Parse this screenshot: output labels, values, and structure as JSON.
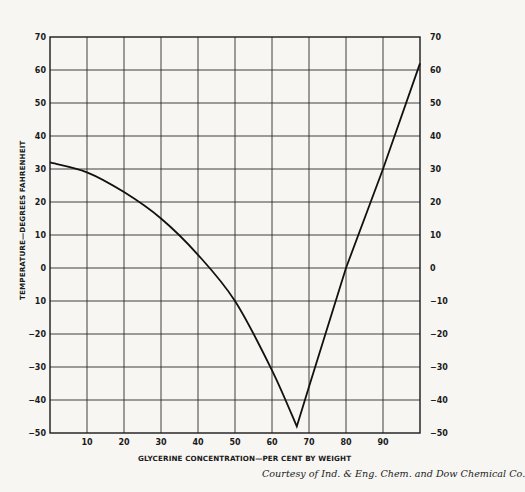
{
  "chart_data": {
    "type": "line",
    "title": "",
    "xlabel": "GLYCERINE CONCENTRATION—PER CENT BY WEIGHT",
    "ylabel": "TEMPERATURE—DEGREES FAHRENHEIT",
    "xlim": [
      0,
      100
    ],
    "ylim": [
      -50,
      70
    ],
    "grid": true,
    "x_ticks": [
      10,
      20,
      30,
      40,
      50,
      60,
      70,
      80,
      90
    ],
    "y_ticks_left": [
      70,
      60,
      50,
      40,
      30,
      20,
      10,
      0,
      -10,
      -20,
      -30,
      -40,
      -50
    ],
    "y_ticks_right": [
      70,
      60,
      50,
      40,
      30,
      20,
      10,
      0,
      -10,
      -20,
      -30,
      -40,
      -50
    ],
    "series": [
      {
        "name": "Freezing point of glycerine-water solutions",
        "x": [
          0,
          10,
          20,
          30,
          40,
          50,
          60,
          66.7,
          70,
          80,
          90,
          100
        ],
        "y": [
          32,
          29,
          23,
          15,
          4,
          -10,
          -31,
          -48,
          -36,
          0,
          30,
          62
        ]
      }
    ],
    "annotations": [
      "Courtesy of Ind. & Eng. Chem. and Dow Chemical Co."
    ]
  },
  "labels": {
    "x_axis_title": "GLYCERINE CONCENTRATION—PER CENT BY WEIGHT",
    "y_axis_title": "TEMPERATURE—DEGREES FAHRENHEIT",
    "credit": "Courtesy of Ind. & Eng. Chem. and Dow Chemical Co.",
    "x_ticks": [
      "10",
      "20",
      "30",
      "40",
      "50",
      "60",
      "70",
      "80",
      "90"
    ],
    "y_left": [
      "70",
      "60",
      "50",
      "40",
      "30",
      "20",
      "10",
      "0",
      "10",
      "−20",
      "−30",
      "−40",
      "−50"
    ],
    "y_right": [
      "70",
      "60",
      "50",
      "40",
      "30",
      "20",
      "10",
      "0",
      "−10",
      "−20",
      "−30",
      "−40",
      "−50"
    ]
  },
  "colors": {
    "ink": "#1a1a1a",
    "grid": "#2a2a2a",
    "paper": "#f7f6f3"
  }
}
